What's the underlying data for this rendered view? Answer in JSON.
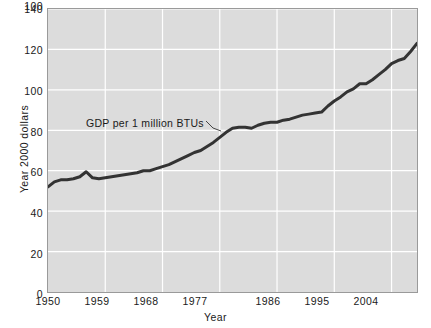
{
  "chart_data": {
    "type": "line",
    "title": "",
    "xlabel": "Year",
    "ylabel": "Year 2000 dollars",
    "xlim": [
      1950,
      2008
    ],
    "ylim": [
      0,
      140
    ],
    "grid": true,
    "legend": "none",
    "xticks": [
      "1950",
      "1959",
      "1968",
      "1977",
      "1986",
      "1995",
      "2004"
    ],
    "xtick_values": [
      1950,
      1959,
      1968,
      1977,
      1986,
      1995,
      2004
    ],
    "yticks": [
      "0",
      "20",
      "40",
      "60",
      "80",
      "100",
      "120",
      "140"
    ],
    "ytick_values": [
      0,
      20,
      40,
      60,
      80,
      100,
      120,
      140
    ],
    "annotations": [
      {
        "text": "GDP per 1 million BTUs",
        "points_to_x": 1981,
        "points_to_y": 81
      }
    ],
    "series": [
      {
        "name": "GDP per 1 million BTUs",
        "color": "#333333",
        "x": [
          1950,
          1951,
          1952,
          1953,
          1954,
          1955,
          1956,
          1957,
          1958,
          1959,
          1960,
          1961,
          1962,
          1963,
          1964,
          1965,
          1966,
          1967,
          1968,
          1969,
          1970,
          1971,
          1972,
          1973,
          1974,
          1975,
          1976,
          1977,
          1978,
          1979,
          1980,
          1981,
          1982,
          1983,
          1984,
          1985,
          1986,
          1987,
          1988,
          1989,
          1990,
          1991,
          1992,
          1993,
          1994,
          1995,
          1996,
          1997,
          1998,
          1999,
          2000,
          2001,
          2002,
          2003,
          2004,
          2005,
          2006,
          2007,
          2008
        ],
        "values": [
          52.0,
          54.5,
          55.5,
          55.5,
          56.0,
          57.0,
          59.5,
          56.5,
          56.0,
          56.5,
          57.0,
          57.5,
          58.0,
          58.5,
          59.0,
          60.0,
          60.0,
          61.0,
          62.0,
          63.0,
          64.5,
          66.0,
          67.5,
          69.0,
          70.0,
          72.0,
          74.0,
          76.5,
          79.0,
          81.0,
          81.5,
          81.5,
          81.0,
          82.5,
          83.5,
          84.0,
          84.0,
          85.0,
          85.5,
          86.5,
          87.5,
          88.0,
          88.5,
          89.0,
          92.0,
          94.5,
          96.5,
          99.0,
          100.5,
          103.0,
          103.0,
          105.0,
          107.5,
          110.0,
          113.0,
          114.5,
          115.5,
          119.0,
          123.0
        ]
      }
    ]
  }
}
